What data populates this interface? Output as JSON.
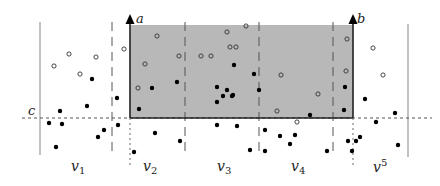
{
  "diagram": {
    "labels": {
      "a": "a",
      "b": "b",
      "c": "c",
      "v1": "v",
      "v1_sub": "1",
      "v2": "v",
      "v2_sub": "2",
      "v3": "v",
      "v3_sub": "3",
      "v4": "v",
      "v4_sub": "4",
      "v5": "v",
      "v5_sup": "5"
    },
    "colors": {
      "shade": "#b8b8b8",
      "line": "#222222",
      "boundary": "#888888",
      "point": "#000000"
    },
    "region": {
      "x1": 130,
      "x2": 353,
      "y_top": 25,
      "y_bottom": 118
    },
    "query_line_c": {
      "y": 118,
      "x_from": 22,
      "x_to": 432
    },
    "outer_boundaries": [
      40,
      408
    ],
    "slab_dividers": [
      112,
      185,
      259,
      333
    ],
    "filled_points": [
      [
        92,
        79
      ],
      [
        87,
        106
      ],
      [
        60,
        111
      ],
      [
        49,
        123
      ],
      [
        62,
        124
      ],
      [
        98,
        137
      ],
      [
        104,
        130
      ],
      [
        56,
        147
      ],
      [
        117,
        98
      ],
      [
        118,
        125
      ],
      [
        139,
        109
      ],
      [
        152,
        88
      ],
      [
        177,
        82
      ],
      [
        134,
        152
      ],
      [
        155,
        133
      ],
      [
        180,
        141
      ],
      [
        217,
        87
      ],
      [
        217,
        102
      ],
      [
        227,
        90
      ],
      [
        233,
        95
      ],
      [
        217,
        125
      ],
      [
        237,
        126
      ],
      [
        223,
        96
      ],
      [
        234,
        65
      ],
      [
        254,
        74
      ],
      [
        232,
        96
      ],
      [
        265,
        130
      ],
      [
        250,
        150
      ],
      [
        265,
        151
      ],
      [
        280,
        136
      ],
      [
        295,
        135
      ],
      [
        290,
        144
      ],
      [
        310,
        115
      ],
      [
        327,
        151
      ],
      [
        345,
        87
      ],
      [
        344,
        110
      ],
      [
        348,
        141
      ],
      [
        352,
        151
      ],
      [
        356,
        141
      ],
      [
        365,
        99
      ],
      [
        376,
        122
      ],
      [
        360,
        137
      ],
      [
        395,
        113
      ],
      [
        398,
        145
      ],
      [
        259,
        90
      ]
    ],
    "open_points": [
      [
        54,
        66
      ],
      [
        69,
        54
      ],
      [
        96,
        57
      ],
      [
        80,
        74
      ],
      [
        124,
        49
      ],
      [
        157,
        36
      ],
      [
        145,
        64
      ],
      [
        179,
        56
      ],
      [
        138,
        88
      ],
      [
        201,
        56
      ],
      [
        211,
        56
      ],
      [
        227,
        32
      ],
      [
        230,
        47
      ],
      [
        236,
        47
      ],
      [
        246,
        26
      ],
      [
        281,
        75
      ],
      [
        318,
        94
      ],
      [
        277,
        111
      ],
      [
        297,
        122
      ],
      [
        347,
        39
      ],
      [
        346,
        71
      ],
      [
        373,
        48
      ],
      [
        383,
        75
      ]
    ]
  }
}
